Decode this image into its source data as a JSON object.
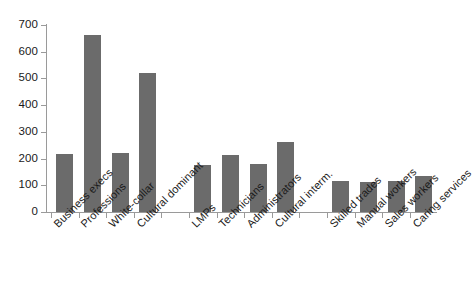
{
  "chart_data": {
    "type": "bar",
    "title": "",
    "subtitle": "",
    "xlabel": "",
    "ylabel": "",
    "ylim": [
      0,
      700
    ],
    "yticks": [
      0,
      100,
      200,
      300,
      400,
      500,
      600,
      700
    ],
    "grid": false,
    "legend": null,
    "bar_color": "#6b6b6b",
    "axis_color": "#9a9a9a",
    "categories": [
      "Business execs",
      "Professions",
      "White-collar",
      "Cultural dominant",
      "LMPs",
      "Technicians",
      "Administrators",
      "Cultural interm.",
      "Skilled trades",
      "Manual workers",
      "Sales workers",
      "Caring services"
    ],
    "values": [
      218,
      662,
      222,
      520,
      175,
      212,
      178,
      262,
      117,
      112,
      117,
      134
    ],
    "groups": [
      {
        "name": "Dominant",
        "categories": [
          "Business execs",
          "Professions",
          "White-collar",
          "Cultural dominant"
        ],
        "values": [
          218,
          662,
          222,
          520
        ]
      },
      {
        "name": "Intermediate",
        "categories": [
          "LMPs",
          "Technicians",
          "Administrators",
          "Cultural interm."
        ],
        "values": [
          175,
          212,
          178,
          262
        ]
      },
      {
        "name": "Working",
        "categories": [
          "Skilled trades",
          "Manual workers",
          "Sales workers",
          "Caring services"
        ],
        "values": [
          117,
          112,
          117,
          134
        ]
      }
    ]
  },
  "axis": {
    "y_tick_labels": [
      "0",
      "100",
      "200",
      "300",
      "400",
      "500",
      "600",
      "700"
    ]
  }
}
